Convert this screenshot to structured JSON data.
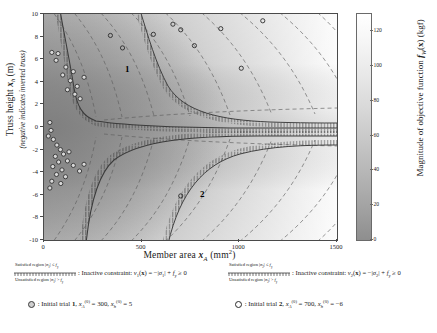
{
  "figure": {
    "type": "contour-heatmap-with-constraints",
    "xlabel_html": "Member area <span class=\"bi\">x</span><span class=\"it sub\">A</span>&nbsp;(mm<span class=\"sup\">2</span>)",
    "ylabel_main_html": "Truss height <span class=\"bi\">x</span><span class=\"it sub\">h</span>&nbsp;(m)",
    "ylabel_sub": "(negative indicates inverted truss)",
    "colorbar_label_html": "Magnitude of objective function <span class=\"bi\">f</span><span class=\"it sub\">W</span>(<b>x</b>) (kgf)"
  },
  "chart_data": {
    "type": "heatmap",
    "title": "",
    "xlabel": "Member area x_A (mm^2)",
    "ylabel": "Truss height x_h (m)",
    "ylabel_note": "(negative indicates inverted truss)",
    "colorbar_label": "Magnitude of objective function f_W(x) (kgf)",
    "xlim": [
      0,
      1500
    ],
    "ylim": [
      -10,
      10
    ],
    "xticks": [
      0,
      500,
      1000,
      1500
    ],
    "yticks": [
      10,
      8,
      6,
      4,
      2,
      0,
      -2,
      -4,
      -6,
      -8,
      -10
    ],
    "xtick_labels": [
      "0",
      "500",
      "1000",
      "1500"
    ],
    "ytick_labels": [
      "10",
      "8",
      "6",
      "4",
      "2",
      "0",
      "-2",
      "-4",
      "-6",
      "-8",
      "-10"
    ],
    "colorbar_ticks": [
      0,
      20,
      40,
      60,
      80,
      100,
      120
    ],
    "colorbar_tick_labels": [
      "0",
      "20",
      "40",
      "60",
      "80",
      "100",
      "120"
    ],
    "colorbar_range": [
      0,
      130
    ],
    "colormap": "grayscale-light-high",
    "grid": false,
    "legend_position": "below-axes",
    "contour_style": "dashed",
    "annotations": [
      {
        "label": "1",
        "x": 390,
        "y": 5.0
      },
      {
        "label": "2",
        "x": 760,
        "y": -6.1
      }
    ],
    "series": [
      {
        "name": "Initial trial 1 search path",
        "marker": "filled-circle",
        "points_xy": [
          [
            40,
            6.6
          ],
          [
            72,
            6.5
          ],
          [
            112,
            5.3
          ],
          [
            150,
            4.9
          ],
          [
            62,
            5.9
          ],
          [
            96,
            4.6
          ],
          [
            135,
            4.1
          ],
          [
            170,
            3.6
          ],
          [
            120,
            3.3
          ],
          [
            158,
            2.9
          ],
          [
            185,
            2.5
          ],
          [
            205,
            4.4
          ],
          [
            30,
            0.4
          ],
          [
            36,
            -0.3
          ],
          [
            22,
            -0.8
          ],
          [
            48,
            -1.1
          ],
          [
            66,
            -1.6
          ],
          [
            84,
            -2.0
          ],
          [
            58,
            -2.6
          ],
          [
            100,
            -2.4
          ],
          [
            75,
            -3.1
          ],
          [
            120,
            -3.0
          ],
          [
            45,
            -3.5
          ],
          [
            92,
            -3.8
          ],
          [
            150,
            -3.4
          ],
          [
            64,
            -4.2
          ],
          [
            110,
            -4.4
          ],
          [
            182,
            -3.9
          ],
          [
            40,
            -4.8
          ],
          [
            86,
            -5.0
          ],
          [
            30,
            -5.4
          ],
          [
            128,
            -2.2
          ],
          [
            205,
            -3.3
          ]
        ]
      },
      {
        "name": "Initial trial 2 search path",
        "marker": "open-circle",
        "points_xy": [
          [
            340,
            8.1
          ],
          [
            402,
            7.0
          ],
          [
            560,
            8.2
          ],
          [
            660,
            9.1
          ],
          [
            700,
            8.6
          ],
          [
            770,
            7.2
          ],
          [
            905,
            8.7
          ],
          [
            1010,
            5.2
          ],
          [
            1120,
            9.4
          ],
          [
            700,
            -6.1
          ]
        ]
      }
    ],
    "constraint_curves": [
      {
        "name": "v1",
        "style": "hatched-boundary"
      },
      {
        "name": "v2",
        "style": "hatched-boundary"
      }
    ]
  },
  "legend": {
    "constraints": [
      {
        "satisfied_html": "Satisfied region |<span class=\"it\">&sigma;</span><span class=\"sub\">1</span>| &le; <span class=\"it\">f</span><span class=\"sub\">y</span>",
        "unsatisfied_html": "Unsatisfied region |<span class=\"it\">&sigma;</span><span class=\"sub\">1</span>| &gt; <span class=\"it\">f</span><span class=\"sub\">y</span>",
        "text_html": ": Inactive constraint: <span class=\"it\">v</span><span class=\"sub\">1</span>(<b>x</b>) = &minus;|<span class=\"it\">&sigma;</span><span class=\"sub\">1</span>| + <span class=\"it\">f</span><span class=\"sub\">y</span> &ge; 0"
      },
      {
        "satisfied_html": "Satisfied region |<span class=\"it\">&sigma;</span><span class=\"sub\">2</span>| &le; <span class=\"it\">f</span><span class=\"sub\">y</span>",
        "unsatisfied_html": "Unsatisfied region |<span class=\"it\">&sigma;</span><span class=\"sub\">2</span>| &gt; <span class=\"it\">f</span><span class=\"sub\">y</span>",
        "text_html": ": Inactive constraint: <span class=\"it\">v</span><span class=\"sub\">2</span>(<b>x</b>) = &minus;|<span class=\"it\">&sigma;</span><span class=\"sub\">2</span>| + <span class=\"it\">f</span><span class=\"sub\">y</span> &ge; 0"
      }
    ],
    "trials": [
      {
        "marker": "filled-circle",
        "text_html": ": Initial trial <b>1</b>, <span class=\"it\">x</span><span class=\"it sub\">A</span><span class=\"sup\">(0)</span> = 300, <span class=\"it\">x</span><span class=\"it sub\">h</span><span class=\"sup\">(0)</span> = 5"
      },
      {
        "marker": "open-circle",
        "text_html": ": Initial trial <b>2</b>, <span class=\"it\">x</span><span class=\"it sub\">A</span><span class=\"sup\">(0)</span> = 700, <span class=\"it\">x</span><span class=\"it sub\">h</span><span class=\"sup\">(0)</span> = &minus;6"
      }
    ]
  },
  "colors": {
    "low": "#8e8e8e",
    "high": "#ffffff",
    "axis": "#4a4a4a",
    "contour": "#5a5a5a",
    "constraint": "#3d3d3d",
    "marker_fill": "#d8d8d8",
    "marker_edge": "#333333"
  }
}
